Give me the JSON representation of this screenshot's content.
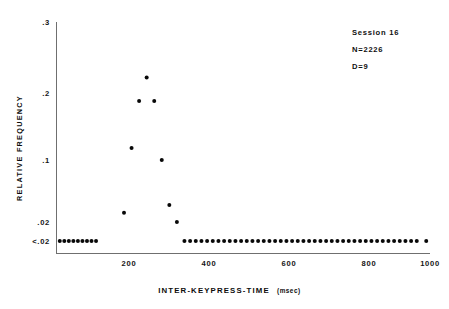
{
  "chart_data": {
    "type": "scatter",
    "title": "",
    "xlabel": "INTER-KEYPRESS-TIME",
    "xunits": "(msec)",
    "ylabel": "RELATIVE FREQUENCY",
    "xlim": [
      20,
      1010
    ],
    "ylim": [
      0,
      0.3
    ],
    "grid": false,
    "legend": null,
    "xticks": [
      200,
      400,
      600,
      800,
      1000
    ],
    "xtick_labels": [
      "200",
      "400",
      "600",
      "800",
      "1000"
    ],
    "yticks": [
      0.3,
      0.2,
      0.1,
      0.02,
      0.0
    ],
    "ytick_labels": [
      ".3",
      ".2",
      ".1",
      ".02",
      "<.02"
    ],
    "annotations": [
      "Session  16",
      "N=2226",
      "D=9"
    ],
    "marker": "filled-circle",
    "marker_color": "#080808",
    "series": [
      {
        "name": "relative frequency of inter-keypress times",
        "x": [
          30,
          42,
          54,
          66,
          78,
          90,
          102,
          114,
          126,
          200,
          220,
          240,
          260,
          280,
          300,
          320,
          340,
          360,
          375,
          390,
          405,
          420,
          435,
          450,
          465,
          480,
          495,
          510,
          525,
          540,
          555,
          570,
          585,
          600,
          615,
          630,
          645,
          660,
          675,
          690,
          705,
          720,
          735,
          750,
          765,
          780,
          795,
          810,
          825,
          840,
          855,
          870,
          885,
          900,
          915,
          930,
          945,
          960,
          975,
          1000
        ],
        "y": [
          0.0,
          0.0,
          0.0,
          0.0,
          0.0,
          0.0,
          0.0,
          0.0,
          0.0,
          0.032,
          0.118,
          0.188,
          0.222,
          0.188,
          0.1,
          0.042,
          0.02,
          0.0,
          0.0,
          0.0,
          0.0,
          0.0,
          0.0,
          0.0,
          0.0,
          0.0,
          0.0,
          0.0,
          0.0,
          0.0,
          0.0,
          0.0,
          0.0,
          0.0,
          0.0,
          0.0,
          0.0,
          0.0,
          0.0,
          0.0,
          0.0,
          0.0,
          0.0,
          0.0,
          0.0,
          0.0,
          0.0,
          0.0,
          0.0,
          0.0,
          0.0,
          0.0,
          0.0,
          0.0,
          0.0,
          0.0,
          0.0,
          0.0,
          0.0,
          0.0
        ]
      }
    ]
  },
  "geometry": {
    "plot_left": 56,
    "plot_right": 430,
    "plot_top": 22,
    "plot_bottom": 253,
    "baseline_y": 241,
    "tick_y_positions": [
      22,
      93,
      160,
      222,
      241
    ],
    "tick_x_positions": [
      129,
      209,
      289,
      369,
      430
    ]
  }
}
